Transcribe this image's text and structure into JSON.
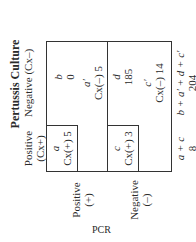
{
  "title": "Pertussis Culture",
  "row_axis_label": "PCR",
  "columns": [
    {
      "label": "Positive",
      "sub": "(Cx+)"
    },
    {
      "label": "Negative (Cx–)"
    }
  ],
  "rows": [
    {
      "label": "Positive",
      "sub": "(+)"
    },
    {
      "label": "Negative",
      "sub": "(–)"
    }
  ],
  "cells": {
    "a": {
      "var": "a",
      "text": "Cx(+) 5"
    },
    "b": {
      "var": "b",
      "text": "0"
    },
    "a_prime": {
      "var": "a′",
      "text": "Cx(–) 5"
    },
    "c": {
      "var": "c",
      "text": "Cx(+) 3"
    },
    "d": {
      "var": "d",
      "text": "185"
    },
    "c_prime": {
      "var": "c′",
      "text": "Cx(–) 14"
    }
  },
  "totals": [
    {
      "formula": "a + c",
      "value": "8"
    },
    {
      "formula": "b + a′ + d + c′",
      "value": "204"
    }
  ]
}
